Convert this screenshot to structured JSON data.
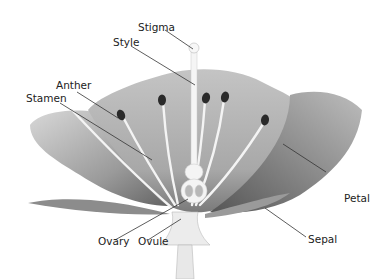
{
  "diagram": {
    "labels": {
      "stigma": "Stigma",
      "style": "Style",
      "anther": "Anther",
      "stamen": "Stamen",
      "petal": "Petal",
      "sepal": "Sepal",
      "ovary": "Ovary",
      "ovule": "Ovule"
    },
    "colors": {
      "background": "#ffffff",
      "petal_light": "#c9c9c9",
      "petal_dark": "#6e6e6e",
      "anther": "#2a2a2a",
      "filament": "#f2f2f2",
      "leader_line": "#333333",
      "text": "#222222"
    }
  }
}
